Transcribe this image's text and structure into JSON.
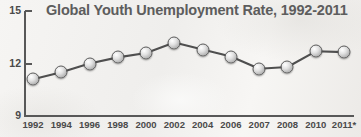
{
  "chart_data": {
    "type": "line",
    "title": "Global Youth Unemployment Rate, 1992-2011",
    "xlabel": "",
    "ylabel": "",
    "ylim": [
      9,
      15
    ],
    "yticks": [
      "15",
      "12",
      "9"
    ],
    "grid": false,
    "legend": null,
    "marker": "filled-gray-circle",
    "categories": [
      "1992",
      "1994",
      "1996",
      "1998",
      "2000",
      "2002",
      "2004",
      "2006",
      "2007",
      "2008",
      "2010",
      "2011*"
    ],
    "values": [
      11.1,
      11.5,
      12.0,
      12.35,
      12.6,
      13.2,
      12.8,
      12.4,
      11.7,
      11.8,
      12.7,
      12.65
    ],
    "points": [
      {
        "label": "1992",
        "value": 11.1
      },
      {
        "label": "1994",
        "value": 11.5
      },
      {
        "label": "1996",
        "value": 12.0
      },
      {
        "label": "1998",
        "value": 12.35
      },
      {
        "label": "2000",
        "value": 12.6
      },
      {
        "label": "2002",
        "value": 13.2
      },
      {
        "label": "2004",
        "value": 12.8
      },
      {
        "label": "2006",
        "value": 12.4
      },
      {
        "label": "2007",
        "value": 11.7
      },
      {
        "label": "2008",
        "value": 11.8
      },
      {
        "label": "2010",
        "value": 12.7
      },
      {
        "label": "2011*",
        "value": 12.65
      }
    ],
    "colors": {
      "line": "#4f4f4f",
      "marker_fill": "#cfcfcf",
      "marker_stroke": "#5a5a5a",
      "axis": "#585858",
      "title_text": "#5d5d5d",
      "tick_text": "#4a4a4a",
      "background": "#f4f3f1"
    }
  }
}
